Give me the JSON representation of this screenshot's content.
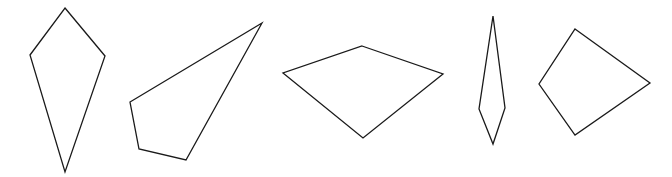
{
  "canvas": {
    "width": 672,
    "height": 177,
    "background_color": "#ffffff",
    "stroke_color": "#1a1a1a",
    "stroke_width": 1.3,
    "fill": "none",
    "description": "Row of five outlined quadrilateral shapes on a plain white background"
  },
  "shapes": [
    {
      "id": "shape-1",
      "name": "kite-quadrilateral",
      "sides": 4,
      "points": "65,8 105,56 65,172 30,55",
      "vertices": [
        [
          65,
          8
        ],
        [
          105,
          56
        ],
        [
          65,
          172
        ],
        [
          30,
          55
        ]
      ]
    },
    {
      "id": "shape-2",
      "name": "elongated-dart-quadrilateral",
      "sides": 4,
      "points": "262,23 186,160 139,149 130,102",
      "vertices": [
        [
          262,
          23
        ],
        [
          186,
          160
        ],
        [
          139,
          149
        ],
        [
          130,
          102
        ]
      ]
    },
    {
      "id": "shape-3",
      "name": "wide-flat-quadrilateral",
      "sides": 4,
      "points": "362,46 443,74 363,138 283,73",
      "vertices": [
        [
          362,
          46
        ],
        [
          443,
          74
        ],
        [
          363,
          138
        ],
        [
          283,
          73
        ]
      ]
    },
    {
      "id": "shape-4",
      "name": "narrow-sliver-quadrilateral",
      "sides": 4,
      "points": "493,16 505,108 493,144 479,109",
      "vertices": [
        [
          493,
          16
        ],
        [
          505,
          108
        ],
        [
          493,
          144
        ],
        [
          479,
          109
        ]
      ]
    },
    {
      "id": "shape-5",
      "name": "tilted-square-quadrilateral",
      "sides": 4,
      "points": "575,29 650,83 575,135 539,84",
      "vertices": [
        [
          575,
          29
        ],
        [
          650,
          83
        ],
        [
          575,
          135
        ],
        [
          539,
          84
        ]
      ]
    }
  ]
}
